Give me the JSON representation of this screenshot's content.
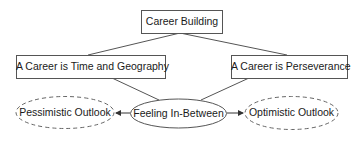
{
  "diagram": {
    "colors": {
      "stroke": "#555555",
      "text": "#1a1a1a",
      "background": "#ffffff"
    },
    "nodes": {
      "root": {
        "label": "Career Building",
        "shape": "rectangle"
      },
      "left": {
        "label": "A Career is Time and Geography",
        "shape": "rectangle"
      },
      "right": {
        "label": "A Career is Perseverance",
        "shape": "rectangle"
      },
      "center": {
        "label": "Feeling In-Between",
        "shape": "ellipse"
      },
      "pessimistic": {
        "label": "Pessimistic Outlook",
        "shape": "dashed-ellipse"
      },
      "optimistic": {
        "label": "Optimistic Outlook",
        "shape": "dashed-ellipse"
      }
    },
    "edges": [
      {
        "from": "root",
        "to": "left",
        "arrow": false
      },
      {
        "from": "root",
        "to": "right",
        "arrow": false
      },
      {
        "from": "left",
        "to": "center",
        "arrow": false
      },
      {
        "from": "right",
        "to": "center",
        "arrow": false
      },
      {
        "from": "center",
        "to": "pessimistic",
        "arrow": true
      },
      {
        "from": "center",
        "to": "optimistic",
        "arrow": true
      }
    ]
  }
}
